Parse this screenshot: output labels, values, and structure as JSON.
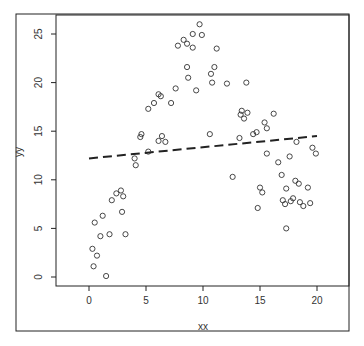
{
  "chart_data": {
    "type": "scatter",
    "title": "",
    "xlabel": "xx",
    "ylabel": "yy",
    "xlim": [
      -2.9,
      22.9
    ],
    "ylim": [
      -0.8,
      27.0
    ],
    "grid": false,
    "legend": null,
    "x_ticks": [
      0,
      5,
      10,
      15,
      20
    ],
    "y_ticks": [
      0,
      5,
      10,
      15,
      20,
      25
    ],
    "marker": "open-circle",
    "regression_line": {
      "style": "dashed",
      "x": [
        0,
        20
      ],
      "y": [
        12.2,
        14.5
      ]
    },
    "points": [
      {
        "x": 0.3,
        "y": 2.9
      },
      {
        "x": 0.4,
        "y": 1.1
      },
      {
        "x": 0.5,
        "y": 5.6
      },
      {
        "x": 0.7,
        "y": 2.2
      },
      {
        "x": 1.0,
        "y": 4.2
      },
      {
        "x": 1.2,
        "y": 6.3
      },
      {
        "x": 1.5,
        "y": 0.1
      },
      {
        "x": 1.8,
        "y": 4.4
      },
      {
        "x": 2.0,
        "y": 7.9
      },
      {
        "x": 2.4,
        "y": 8.6
      },
      {
        "x": 2.8,
        "y": 8.9
      },
      {
        "x": 2.9,
        "y": 6.7
      },
      {
        "x": 3.0,
        "y": 8.3
      },
      {
        "x": 3.2,
        "y": 4.4
      },
      {
        "x": 4.0,
        "y": 12.2
      },
      {
        "x": 4.1,
        "y": 11.5
      },
      {
        "x": 4.5,
        "y": 14.4
      },
      {
        "x": 4.6,
        "y": 14.7
      },
      {
        "x": 5.2,
        "y": 12.9
      },
      {
        "x": 5.2,
        "y": 17.3
      },
      {
        "x": 5.7,
        "y": 17.9
      },
      {
        "x": 6.1,
        "y": 18.8
      },
      {
        "x": 6.3,
        "y": 18.6
      },
      {
        "x": 6.1,
        "y": 14.0
      },
      {
        "x": 6.4,
        "y": 14.5
      },
      {
        "x": 6.7,
        "y": 13.9
      },
      {
        "x": 7.2,
        "y": 17.9
      },
      {
        "x": 7.6,
        "y": 19.4
      },
      {
        "x": 7.8,
        "y": 23.8
      },
      {
        "x": 8.3,
        "y": 24.4
      },
      {
        "x": 8.6,
        "y": 24.0
      },
      {
        "x": 8.6,
        "y": 21.6
      },
      {
        "x": 8.7,
        "y": 20.5
      },
      {
        "x": 9.1,
        "y": 23.6
      },
      {
        "x": 9.1,
        "y": 25.0
      },
      {
        "x": 9.4,
        "y": 19.2
      },
      {
        "x": 9.7,
        "y": 26.0
      },
      {
        "x": 9.9,
        "y": 24.9
      },
      {
        "x": 10.7,
        "y": 20.9
      },
      {
        "x": 10.8,
        "y": 20.0
      },
      {
        "x": 11.0,
        "y": 21.6
      },
      {
        "x": 11.2,
        "y": 23.5
      },
      {
        "x": 10.6,
        "y": 14.7
      },
      {
        "x": 12.1,
        "y": 19.9
      },
      {
        "x": 12.6,
        "y": 10.3
      },
      {
        "x": 13.3,
        "y": 16.7
      },
      {
        "x": 13.4,
        "y": 17.1
      },
      {
        "x": 13.6,
        "y": 16.3
      },
      {
        "x": 13.8,
        "y": 20.0
      },
      {
        "x": 13.9,
        "y": 16.9
      },
      {
        "x": 13.2,
        "y": 14.3
      },
      {
        "x": 14.4,
        "y": 14.7
      },
      {
        "x": 14.7,
        "y": 14.9
      },
      {
        "x": 15.0,
        "y": 9.2
      },
      {
        "x": 14.8,
        "y": 7.1
      },
      {
        "x": 15.2,
        "y": 8.7
      },
      {
        "x": 15.4,
        "y": 15.9
      },
      {
        "x": 15.6,
        "y": 15.3
      },
      {
        "x": 15.6,
        "y": 12.7
      },
      {
        "x": 16.2,
        "y": 16.8
      },
      {
        "x": 16.6,
        "y": 11.8
      },
      {
        "x": 16.9,
        "y": 10.5
      },
      {
        "x": 17.0,
        "y": 7.9
      },
      {
        "x": 17.2,
        "y": 7.5
      },
      {
        "x": 17.3,
        "y": 9.1
      },
      {
        "x": 17.3,
        "y": 5.0
      },
      {
        "x": 17.6,
        "y": 12.4
      },
      {
        "x": 17.7,
        "y": 7.8
      },
      {
        "x": 17.9,
        "y": 8.1
      },
      {
        "x": 18.1,
        "y": 9.9
      },
      {
        "x": 18.2,
        "y": 13.9
      },
      {
        "x": 18.4,
        "y": 9.6
      },
      {
        "x": 18.5,
        "y": 7.7
      },
      {
        "x": 18.8,
        "y": 7.3
      },
      {
        "x": 19.2,
        "y": 9.2
      },
      {
        "x": 19.4,
        "y": 7.6
      },
      {
        "x": 19.6,
        "y": 13.3
      },
      {
        "x": 19.9,
        "y": 12.7
      }
    ]
  }
}
